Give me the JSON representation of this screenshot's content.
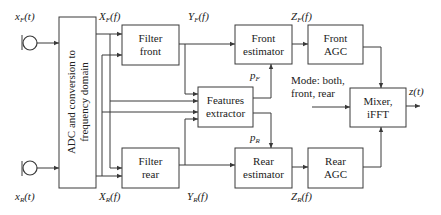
{
  "diagram": {
    "type": "block-diagram",
    "blocks": {
      "adc": {
        "line1": "ADC and conversion to",
        "line2": "frequency domain"
      },
      "filter_front": {
        "line1": "Filter",
        "line2": "front"
      },
      "filter_rear": {
        "line1": "Filter",
        "line2": "rear"
      },
      "features": {
        "line1": "Features",
        "line2": "extractor"
      },
      "front_estimator": {
        "line1": "Front",
        "line2": "estimator"
      },
      "rear_estimator": {
        "line1": "Rear",
        "line2": "estimator"
      },
      "front_agc": {
        "line1": "Front",
        "line2": "AGC"
      },
      "rear_agc": {
        "line1": "Rear",
        "line2": "AGC"
      },
      "mixer": {
        "line1": "Mixer,",
        "line2": "iFFT"
      }
    },
    "signals": {
      "xf_t": "x_F(t)",
      "xr_t": "x_R(t)",
      "xf_f": "X_F(f)",
      "xr_f": "X_R(f)",
      "yf_f": "Y_F(f)",
      "yr_f": "Y_R(f)",
      "pf": "p_F",
      "pr": "p_R",
      "zf_f": "Z_F(f)",
      "zr_f": "Z_R(f)",
      "z_t": "z(t)"
    },
    "signal_parts": {
      "xf_t": {
        "base": "x",
        "sub": "F",
        "tail": "(t)"
      },
      "xr_t": {
        "base": "x",
        "sub": "R",
        "tail": "(t)"
      },
      "xf_f": {
        "base": "X",
        "sub": "F",
        "tail": "(f)"
      },
      "xr_f": {
        "base": "X",
        "sub": "R",
        "tail": "(f)"
      },
      "yf_f": {
        "base": "Y",
        "sub": "F",
        "tail": "(f)"
      },
      "yr_f": {
        "base": "Y",
        "sub": "R",
        "tail": "(f)"
      },
      "pf": {
        "base": "p",
        "sub": "F",
        "tail": ""
      },
      "pr": {
        "base": "p",
        "sub": "R",
        "tail": ""
      },
      "zf_f": {
        "base": "Z",
        "sub": "F",
        "tail": "(f)"
      },
      "zr_f": {
        "base": "Z",
        "sub": "R",
        "tail": "(f)"
      },
      "z_t": {
        "base": "z(t)",
        "sub": "",
        "tail": ""
      }
    },
    "mode": {
      "line1": "Mode: both,",
      "line2": "front, rear"
    },
    "icons": {
      "front_mic": "microphone-icon",
      "rear_mic": "microphone-icon"
    },
    "colors": {
      "stroke": "#3a3a3a",
      "text": "#222222",
      "background": "#ffffff"
    }
  }
}
